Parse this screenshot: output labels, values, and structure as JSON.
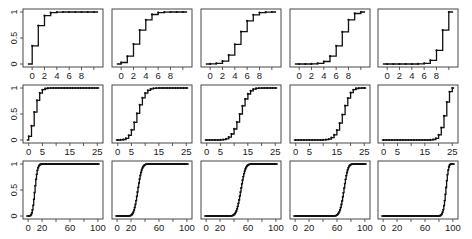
{
  "figure": {
    "rows": 3,
    "cols": 5
  },
  "chart_data": [
    {
      "type": "line",
      "style": "step",
      "row": 0,
      "col": 0,
      "n": 10,
      "p": 0.1,
      "xlim": [
        -1,
        11
      ],
      "ylim": [
        0,
        1
      ],
      "xticks": [
        0,
        2,
        4,
        6,
        8
      ],
      "xticklabels": [
        "0",
        "2",
        "4",
        "6",
        "8"
      ],
      "yticks": [
        0,
        0.5,
        1
      ],
      "yticklabels": [
        "0",
        "0.5",
        "1"
      ]
    },
    {
      "type": "line",
      "style": "step",
      "row": 0,
      "col": 1,
      "n": 10,
      "p": 0.3,
      "xlim": [
        -1,
        11
      ],
      "ylim": [
        0,
        1
      ],
      "xticks": [
        0,
        2,
        4,
        6,
        8
      ],
      "xticklabels": [
        "0",
        "2",
        "4",
        "6",
        "8"
      ]
    },
    {
      "type": "line",
      "style": "step",
      "row": 0,
      "col": 2,
      "n": 10,
      "p": 0.5,
      "xlim": [
        -1,
        11
      ],
      "ylim": [
        0,
        1
      ],
      "xticks": [
        0,
        2,
        4,
        6,
        8
      ],
      "xticklabels": [
        "0",
        "2",
        "4",
        "6",
        "8"
      ]
    },
    {
      "type": "line",
      "style": "step",
      "row": 0,
      "col": 3,
      "n": 10,
      "p": 0.7,
      "xlim": [
        -1,
        11
      ],
      "ylim": [
        0,
        1
      ],
      "xticks": [
        0,
        2,
        4,
        6,
        8
      ],
      "xticklabels": [
        "0",
        "2",
        "4",
        "6",
        "8"
      ]
    },
    {
      "type": "line",
      "style": "step",
      "row": 0,
      "col": 4,
      "n": 10,
      "p": 0.9,
      "xlim": [
        -1,
        11
      ],
      "ylim": [
        0,
        1
      ],
      "xticks": [
        0,
        2,
        4,
        6,
        8
      ],
      "xticklabels": [
        "0",
        "2",
        "4",
        "6",
        "8"
      ]
    },
    {
      "type": "line",
      "style": "step",
      "row": 1,
      "col": 0,
      "n": 25,
      "p": 0.1,
      "xlim": [
        -1,
        26
      ],
      "ylim": [
        0,
        1
      ],
      "xticks": [
        0,
        5,
        15,
        25
      ],
      "xticklabels": [
        "0",
        "5",
        "15",
        "25"
      ],
      "yticks": [
        0,
        0.5,
        1
      ],
      "yticklabels": [
        "0",
        "0.5",
        "1"
      ]
    },
    {
      "type": "line",
      "style": "step",
      "row": 1,
      "col": 1,
      "n": 25,
      "p": 0.3,
      "xlim": [
        -1,
        26
      ],
      "ylim": [
        0,
        1
      ],
      "xticks": [
        0,
        5,
        15,
        25
      ],
      "xticklabels": [
        "0",
        "5",
        "15",
        "25"
      ]
    },
    {
      "type": "line",
      "style": "step",
      "row": 1,
      "col": 2,
      "n": 25,
      "p": 0.5,
      "xlim": [
        -1,
        26
      ],
      "ylim": [
        0,
        1
      ],
      "xticks": [
        0,
        5,
        15,
        25
      ],
      "xticklabels": [
        "0",
        "5",
        "15",
        "25"
      ]
    },
    {
      "type": "line",
      "style": "step",
      "row": 1,
      "col": 3,
      "n": 25,
      "p": 0.7,
      "xlim": [
        -1,
        26
      ],
      "ylim": [
        0,
        1
      ],
      "xticks": [
        0,
        5,
        15,
        25
      ],
      "xticklabels": [
        "0",
        "5",
        "15",
        "25"
      ]
    },
    {
      "type": "line",
      "style": "step",
      "row": 1,
      "col": 4,
      "n": 25,
      "p": 0.9,
      "xlim": [
        -1,
        26
      ],
      "ylim": [
        0,
        1
      ],
      "xticks": [
        0,
        5,
        15,
        25
      ],
      "xticklabels": [
        "0",
        "5",
        "15",
        "25"
      ]
    },
    {
      "type": "line",
      "style": "step",
      "row": 2,
      "col": 0,
      "n": 100,
      "p": 0.1,
      "xlim": [
        -3,
        103
      ],
      "ylim": [
        0,
        1
      ],
      "xticks": [
        0,
        20,
        60,
        100
      ],
      "xticklabels": [
        "0",
        "20",
        "60",
        "100"
      ],
      "yticks": [
        0,
        0.5,
        1
      ],
      "yticklabels": [
        "0",
        "0.5",
        "1"
      ]
    },
    {
      "type": "line",
      "style": "step",
      "row": 2,
      "col": 1,
      "n": 100,
      "p": 0.3,
      "xlim": [
        -3,
        103
      ],
      "ylim": [
        0,
        1
      ],
      "xticks": [
        0,
        20,
        60,
        100
      ],
      "xticklabels": [
        "0",
        "20",
        "60",
        "100"
      ]
    },
    {
      "type": "line",
      "style": "step",
      "row": 2,
      "col": 2,
      "n": 100,
      "p": 0.5,
      "xlim": [
        -3,
        103
      ],
      "ylim": [
        0,
        1
      ],
      "xticks": [
        0,
        20,
        60,
        100
      ],
      "xticklabels": [
        "0",
        "20",
        "60",
        "100"
      ]
    },
    {
      "type": "line",
      "style": "step",
      "row": 2,
      "col": 3,
      "n": 100,
      "p": 0.7,
      "xlim": [
        -3,
        103
      ],
      "ylim": [
        0,
        1
      ],
      "xticks": [
        0,
        20,
        60,
        100
      ],
      "xticklabels": [
        "0",
        "20",
        "60",
        "100"
      ]
    },
    {
      "type": "line",
      "style": "step",
      "row": 2,
      "col": 4,
      "n": 100,
      "p": 0.9,
      "xlim": [
        -3,
        103
      ],
      "ylim": [
        0,
        1
      ],
      "xticks": [
        0,
        20,
        60,
        100
      ],
      "xticklabels": [
        "0",
        "20",
        "60",
        "100"
      ]
    }
  ]
}
